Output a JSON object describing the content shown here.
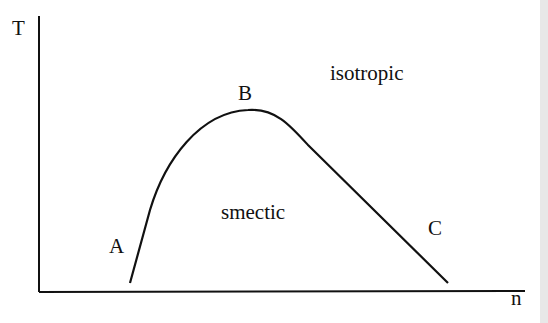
{
  "diagram": {
    "type": "phase-diagram",
    "axes": {
      "y_label": "T",
      "x_label": "n"
    },
    "points": {
      "A": "A",
      "B": "B",
      "C": "C"
    },
    "regions": {
      "inside": "smectic",
      "outside": "isotropic"
    },
    "colors": {
      "line": "#111111",
      "background": "#ffffff"
    }
  }
}
